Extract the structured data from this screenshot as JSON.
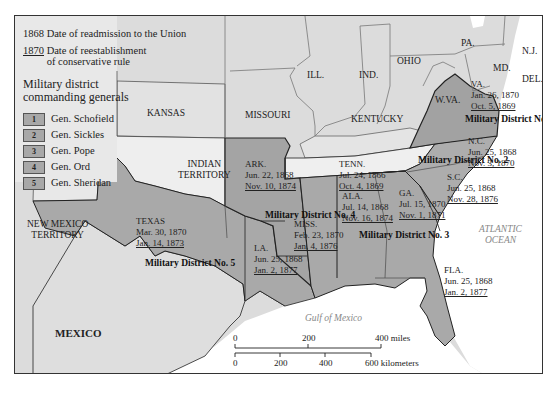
{
  "legend": {
    "readmission_sample": "1868",
    "readmission_label": "Date of readmission to the Union",
    "conservative_sample": "1870",
    "conservative_label_line1": "Date of reestablishment",
    "conservative_label_line2": "of conservative rule",
    "districts_title_line1": "Military district",
    "districts_title_line2": "commanding generals",
    "generals": [
      {
        "num": "1",
        "name": "Gen. Schofield"
      },
      {
        "num": "2",
        "name": "Gen. Sickles"
      },
      {
        "num": "3",
        "name": "Gen. Pope"
      },
      {
        "num": "4",
        "name": "Gen. Ord"
      },
      {
        "num": "5",
        "name": "Gen. Sheridan"
      }
    ]
  },
  "regions": {
    "kansas": "KANSAS",
    "missouri": "MISSOURI",
    "illinois": "ILL.",
    "indiana": "IND.",
    "ohio": "OHIO",
    "pennsylvania": "PA.",
    "new_jersey": "N.J.",
    "maryland": "MD.",
    "delaware": "DEL.",
    "west_virginia": "W.VA.",
    "kentucky": "KENTUCKY",
    "indian_territory_line1": "INDIAN",
    "indian_territory_line2": "TERRITORY",
    "new_mexico_line1": "NEW MEXICO",
    "new_mexico_line2": "TERRITORY",
    "mexico": "MEXICO"
  },
  "states": {
    "virginia": {
      "name": "VA.",
      "readmitted": "Jan. 26, 1870",
      "conservative": "Oct. 5, 1869"
    },
    "north_carolina": {
      "name": "N.C.",
      "readmitted": "Jun. 25, 1868",
      "conservative": "Nov. 3, 1870"
    },
    "tennessee": {
      "name": "TENN.",
      "readmitted": "Jul. 24, 1866",
      "conservative": "Oct. 4, 1869"
    },
    "south_carolina": {
      "name": "S.C.",
      "readmitted": "Jun. 25, 1868",
      "conservative": "Nov. 28, 1876"
    },
    "arkansas": {
      "name": "ARK.",
      "readmitted": "Jun. 22, 1868",
      "conservative": "Nov. 10, 1874"
    },
    "alabama": {
      "name": "ALA.",
      "readmitted": "Jul. 14, 1868",
      "conservative": "Nov. 16, 1874"
    },
    "georgia": {
      "name": "GA.",
      "readmitted": "Jul. 15, 1870",
      "conservative": "Nov. 1, 1871"
    },
    "mississippi": {
      "name": "MISS.",
      "readmitted": "Feb. 23, 1870",
      "conservative": "Jan. 4, 1876"
    },
    "texas": {
      "name": "TEXAS",
      "readmitted": "Mar. 30, 1870",
      "conservative": "Jan. 14, 1873"
    },
    "louisiana": {
      "name": "LA.",
      "readmitted": "Jun. 25, 1868",
      "conservative": "Jan. 2, 1877"
    },
    "florida": {
      "name": "FLA.",
      "readmitted": "Jun. 25, 1868",
      "conservative": "Jan. 2, 1877"
    }
  },
  "districts": {
    "d1": "Military District No. 1",
    "d2": "Military District No. 2",
    "d3": "Military District No. 3",
    "d4": "Military District No. 4",
    "d5": "Military District No. 5"
  },
  "water": {
    "atlantic_line1": "ATLANTIC",
    "atlantic_line2": "OCEAN",
    "gulf": "Gulf of Mexico"
  },
  "scale": {
    "miles": [
      "0",
      "200",
      "400 miles"
    ],
    "km": [
      "0",
      "200",
      "400",
      "600 kilometers"
    ]
  },
  "colors": {
    "district_fill": "#a9a9a9",
    "non_southern_fill": "#dcdcdc",
    "territory_fill": "#e6e6e6",
    "water": "#ffffff",
    "border": "#222222"
  }
}
